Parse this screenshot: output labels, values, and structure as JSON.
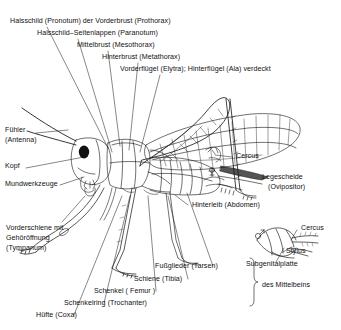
{
  "figure": {
    "title_text": "",
    "ink_color": "#111111",
    "background_color": "#ffffff"
  },
  "labels": {
    "pronotum": "Halsschild (Pronotum) der Vorderbrust (Prothorax)",
    "paranotum": "Halsschild–Seitenlappen (Paranotum)",
    "mesothorax": "Mittelbrust (Mesothorax)",
    "metathorax": "Hinterbrust (Metathorax)",
    "wings": "Vorderflügel (Elytra); Hinterflügel (Ala) verdeckt",
    "antenna_l1": "Fühler",
    "antenna_l2": "(Antenna)",
    "head": "Kopf",
    "mouthparts": "Mundwerkzeuge",
    "tympanum_l1": "Vorderschiene  mit",
    "tympanum_l2": "Gehöröffnung",
    "tympanum_l3": "(Tympanum)",
    "cercus_main": "Cercus",
    "ovipositor_l1": "Legescheide",
    "ovipositor_l2": "(Ovipositor)",
    "abdomen": "Hinterleib (Abdomen)",
    "cercus_inset": "Cercus",
    "stylus": "Stylus",
    "subgenital": "Subgenitalplatte",
    "tarsus": "Fußglieder (Tarsen)",
    "tibia": "Schiene (Tibia)",
    "femur": "Schenkel ( Femur )",
    "trochanter": "Schenkelring  (Trochanter)",
    "coxa": "Hüfte  (Coxa)",
    "midleg_brace": "des  Mittelbeins"
  },
  "symbols": {
    "female": "♀",
    "male": "♂"
  }
}
